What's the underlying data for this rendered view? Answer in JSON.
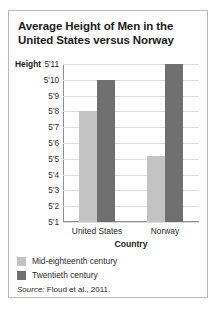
{
  "card": {
    "title": "Average Height of Men in the United States versus Norway",
    "source_keyword": "Source:",
    "source_text": "Floud et al., 2011."
  },
  "chart_data": {
    "type": "bar",
    "title": "Average Height of Men in the United States versus Norway",
    "xlabel": "Country",
    "ylabel": "Height",
    "categories": [
      "United States",
      "Norway"
    ],
    "series": [
      {
        "name": "Mid-eighteenth century",
        "color": "#c3c3c3",
        "values": [
          68,
          65.2
        ],
        "value_labels": [
          "5'8",
          "5'5"
        ]
      },
      {
        "name": "Twentieth century",
        "color": "#6f6f6f",
        "values": [
          70,
          71
        ],
        "value_labels": [
          "5'10",
          "5'11"
        ]
      }
    ],
    "ylim": [
      61,
      71
    ],
    "ytick_values": [
      61,
      62,
      63,
      64,
      65,
      66,
      67,
      68,
      69,
      70,
      71
    ],
    "ytick_labels": [
      "5'1",
      "5'2",
      "5'3",
      "5'4",
      "5'5",
      "5'6",
      "5'7",
      "5'8",
      "5'9",
      "5'10",
      "5'11"
    ],
    "grid": true,
    "legend_position": "below-plot-left",
    "units": "inches"
  }
}
